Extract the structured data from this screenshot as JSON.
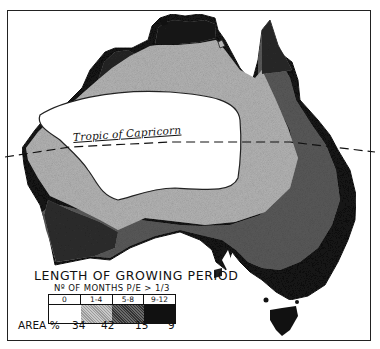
{
  "map": {
    "title": "LENGTH OF GROWING PERIOD",
    "subtitle": "Nº OF MONTHS P/E > 1/3",
    "reference_line_label": "Tropic of Capricorn",
    "legend": {
      "categories": [
        {
          "label": "0",
          "color": "#ffffff",
          "area_pct": "34"
        },
        {
          "label": "1-4",
          "color": "#b8b8b8",
          "area_pct": "42"
        },
        {
          "label": "5-8",
          "color": "#555555",
          "area_pct": "15"
        },
        {
          "label": "9-12",
          "color": "#111111",
          "area_pct": "9"
        }
      ],
      "area_label": "AREA %"
    }
  }
}
